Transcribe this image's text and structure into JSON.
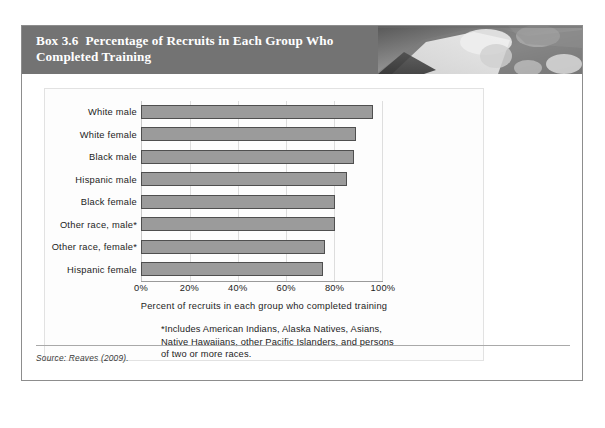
{
  "box": {
    "label": "Box 3.6",
    "title": "Percentage of Recruits in Each Group Who Completed Training",
    "header_photo_alt": "grayscale-photo-of-recruits",
    "source": "Source: Reaves (2009).",
    "border_color": "#8d8d8d",
    "header_color": "#737373"
  },
  "chart_data": {
    "type": "bar",
    "orientation": "horizontal",
    "title": "",
    "xlabel": "Percent of recruits in each group who completed training",
    "ylabel": "",
    "xlim": [
      0,
      100
    ],
    "xticks": [
      0,
      20,
      40,
      60,
      80,
      100
    ],
    "xtick_labels": [
      "0%",
      "20%",
      "40%",
      "60%",
      "80%",
      "100%"
    ],
    "grid": true,
    "legend": "none",
    "bar_fill": "#9b9b9b",
    "bar_edge": "#4f4f4f",
    "categories": [
      "White male",
      "White female",
      "Black male",
      "Hispanic male",
      "Black female",
      "Other race, male*",
      "Other race, female*",
      "Hispanic female"
    ],
    "values": [
      96,
      89,
      88,
      85,
      80,
      80,
      76,
      75
    ],
    "annotations": [
      "*Includes American Indians, Alaska Natives, Asians, Native Hawaiians, other Pacific Islanders, and persons of two or more races."
    ]
  },
  "footnote": {
    "line1": "*Includes American Indians, Alaska Natives, Asians,",
    "line2": "Native Hawaiians, other Pacific Islanders, and persons",
    "line3": "of two or more races."
  }
}
